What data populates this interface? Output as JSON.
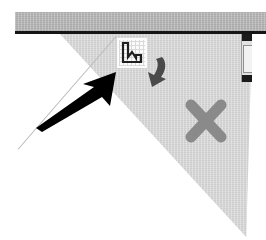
{
  "window": {
    "title": "Application window corner",
    "background_color": "#ffffff"
  },
  "toolbar": {
    "name": "top-toolbar-strip",
    "fill_color": "#b3b3b3",
    "rule_color": "#151515"
  },
  "panel": {
    "name": "clipped-tool-panel",
    "fill_color": "#d5d5d5",
    "divider_color": "#b9b9b9",
    "shape": "triangle"
  },
  "icons": [
    {
      "id": "chart-icon",
      "label": "Chart",
      "tile_color": "#fbfbfb",
      "grid_color": "#d9d9d9",
      "stroke_color": "#1f1f1f"
    },
    {
      "id": "redo-arrow-icon",
      "label": "Redo",
      "fill_color": "#4a4a4a"
    },
    {
      "id": "close-x-icon",
      "label": "Close",
      "fill_color": "#8a8a8a"
    }
  ],
  "scrollbar": {
    "name": "vertical-scrollbar",
    "track_color": "#e2e2e2",
    "button_color": "#1a1a1a",
    "thumb_color": "#f2f2f2"
  },
  "annotation": {
    "name": "pointer-arrow",
    "color": "#000000",
    "direction": "up-right",
    "points_at": "chart-icon"
  }
}
